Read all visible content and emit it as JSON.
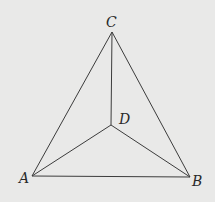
{
  "diagram": {
    "type": "geometry",
    "background": "#e9e9e8",
    "line_color": "#3c3c3c",
    "points": {
      "A": {
        "label": "A",
        "x": 32,
        "y": 176,
        "lx": 19,
        "ly": 183
      },
      "B": {
        "label": "B",
        "x": 190,
        "y": 177,
        "lx": 192,
        "ly": 186
      },
      "C": {
        "label": "C",
        "x": 112,
        "y": 32,
        "lx": 106,
        "ly": 27
      },
      "D": {
        "label": "D",
        "x": 111,
        "y": 125,
        "lx": 119,
        "ly": 124
      }
    },
    "edges": [
      [
        "A",
        "B"
      ],
      [
        "B",
        "C"
      ],
      [
        "C",
        "A"
      ],
      [
        "A",
        "D"
      ],
      [
        "B",
        "D"
      ],
      [
        "C",
        "D"
      ]
    ]
  }
}
